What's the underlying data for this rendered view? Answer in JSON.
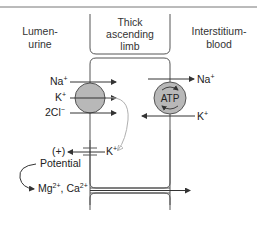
{
  "diagram": {
    "headers": {
      "lumen_line1": "Lumen-",
      "lumen_line2": "urine",
      "cell_line1": "Thick",
      "cell_line2": "ascending",
      "cell_line3": "limb",
      "interstitium_line1": "Interstitium-",
      "interstitium_line2": "blood"
    },
    "cotransporter": {
      "ions": [
        {
          "base": "Na",
          "sup": "+"
        },
        {
          "base": "K",
          "sup": "+"
        },
        {
          "base": "2Cl",
          "sup": "−"
        }
      ]
    },
    "pump": {
      "label": "ATP",
      "out_ion": {
        "base": "Na",
        "sup": "+"
      },
      "in_ion": {
        "base": "K",
        "sup": "+"
      }
    },
    "channel": {
      "ion": {
        "base": "K",
        "sup": "+"
      },
      "charge": "(+)"
    },
    "potential_label": "Potential",
    "paracellular": {
      "mg": {
        "base": "Mg",
        "sup": "2+"
      },
      "sep": ", ",
      "ca": {
        "base": "Ca",
        "sup": "2+"
      }
    },
    "colors": {
      "line": "#4a4a4a",
      "transporter_fill": "#b8b8b8",
      "recycle_arrow": "#b0b0b0"
    }
  }
}
